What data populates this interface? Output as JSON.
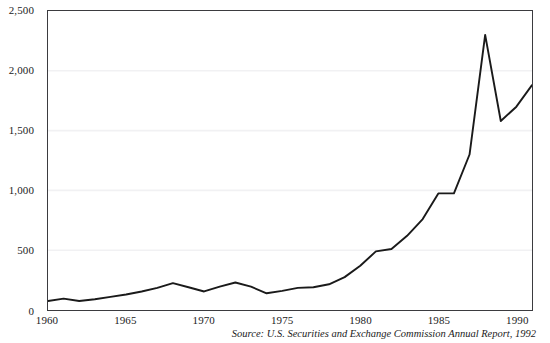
{
  "chart_data": {
    "type": "line",
    "title": "",
    "subtitle": "",
    "xlabel": "",
    "ylabel": "",
    "xlim": [
      1960,
      1991
    ],
    "ylim": [
      0,
      2500
    ],
    "grid": "horizontal",
    "legend": "none",
    "line_color": "#1a1a1a",
    "gridline_color": "#f1f1f3",
    "axis_color": "#3b3b3f",
    "background_color": "#ffffff",
    "x": [
      1960,
      1961,
      1962,
      1963,
      1964,
      1965,
      1966,
      1967,
      1968,
      1969,
      1970,
      1971,
      1972,
      1973,
      1974,
      1975,
      1976,
      1977,
      1978,
      1979,
      1980,
      1981,
      1982,
      1983,
      1984,
      1985,
      1986,
      1987,
      1988,
      1989,
      1990,
      1991
    ],
    "values": [
      75,
      95,
      75,
      90,
      110,
      130,
      155,
      185,
      225,
      190,
      155,
      195,
      230,
      195,
      140,
      160,
      185,
      190,
      215,
      275,
      370,
      490,
      510,
      620,
      760,
      975,
      975,
      1300,
      2300,
      1580,
      1700,
      1880
    ],
    "y_ticks": [
      0,
      500,
      1000,
      1500,
      2000,
      2500
    ],
    "y_tick_labels": [
      "0",
      "500",
      "1,000",
      "1,500",
      "2,000",
      "2,500"
    ],
    "x_ticks": [
      1960,
      1965,
      1970,
      1975,
      1980,
      1985,
      1990
    ],
    "x_tick_labels": [
      "1960",
      "1965",
      "1970",
      "1975",
      "1980",
      "1985",
      "1990"
    ],
    "source_note": "Source: U.S. Securities and Exchange Commission Annual Report, 1992"
  }
}
